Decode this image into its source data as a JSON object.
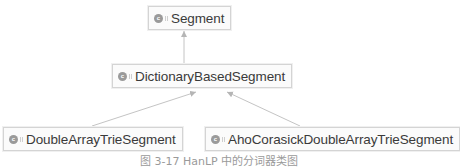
{
  "diagram": {
    "type": "class-hierarchy",
    "nodes": [
      {
        "id": "segment",
        "kind": "class",
        "icon": "class-icon",
        "icon_letter": "c",
        "label": "Segment"
      },
      {
        "id": "dictionary_based_segment",
        "kind": "class",
        "icon": "class-icon",
        "icon_letter": "c",
        "label": "DictionaryBasedSegment"
      },
      {
        "id": "double_array_trie_segment",
        "kind": "class",
        "icon": "class-icon",
        "icon_letter": "c",
        "label": "DoubleArrayTrieSegment"
      },
      {
        "id": "aho_corasick_double_array_trie_segment",
        "kind": "class",
        "icon": "class-icon",
        "icon_letter": "c",
        "label": "AhoCorasickDoubleArrayTrieSegment"
      }
    ],
    "edges": [
      {
        "from": "dictionary_based_segment",
        "to": "segment",
        "relation": "extends"
      },
      {
        "from": "double_array_trie_segment",
        "to": "dictionary_based_segment",
        "relation": "extends"
      },
      {
        "from": "aho_corasick_double_array_trie_segment",
        "to": "dictionary_based_segment",
        "relation": "extends"
      }
    ],
    "caption": "图 3-17  HanLP 中的分词器类图"
  },
  "colors": {
    "box_border": "#d4d4d4",
    "box_fill": "#fbfbfb",
    "edge": "#bdbdbd",
    "text": "#3a3a3a",
    "icon": "#9a9a9a"
  }
}
